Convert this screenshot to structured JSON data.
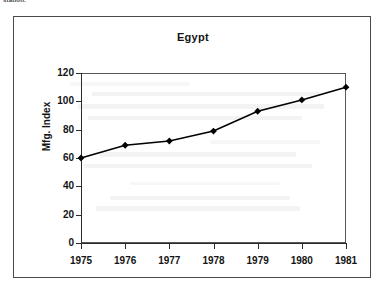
{
  "page": {
    "cut_header_text": "station.",
    "background_color": "#ffffff",
    "border_color": "#4a4a4a"
  },
  "figure": {
    "title": "Egypt",
    "frame_color": "#575757",
    "axis_color": "#2b2b2b",
    "series_color": "#000000"
  },
  "chart_data": {
    "type": "line",
    "title": "Egypt",
    "xlabel": "",
    "ylabel": "Mfg. Index",
    "categories": [
      "1975",
      "1976",
      "1977",
      "1978",
      "1979",
      "1980",
      "1981"
    ],
    "x": [
      1975,
      1976,
      1977,
      1978,
      1979,
      1980,
      1981
    ],
    "values": [
      60,
      69,
      72,
      79,
      93,
      101,
      110
    ],
    "series": [
      {
        "name": "Mfg. Index",
        "values": [
          60,
          69,
          72,
          79,
          93,
          101,
          110
        ],
        "color": "#000000",
        "marker": "diamond",
        "line_width": 1.6
      }
    ],
    "ylim": [
      0,
      120
    ],
    "xlim": [
      1975,
      1981
    ],
    "yticks": [
      0,
      20,
      40,
      60,
      80,
      100,
      120
    ],
    "ytick_labels": [
      "0",
      "20",
      "40",
      "60",
      "80",
      "100",
      "120"
    ],
    "xticks": [
      1975,
      1976,
      1977,
      1978,
      1979,
      1980,
      1981
    ],
    "xtick_labels": [
      "1975",
      "1976",
      "1977",
      "1978",
      "1979",
      "1980",
      "1981"
    ],
    "grid": false,
    "legend": false,
    "legend_position": "none"
  }
}
